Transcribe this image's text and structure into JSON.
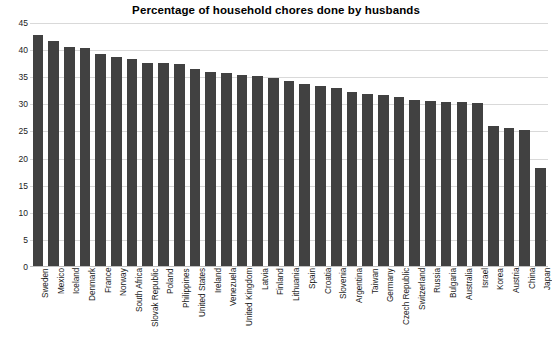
{
  "chart_data": {
    "type": "bar",
    "title": "Percentage of household chores done by husbands",
    "xlabel": "",
    "ylabel": "",
    "ylim": [
      0,
      45
    ],
    "yticks": [
      0,
      5,
      10,
      15,
      20,
      25,
      30,
      35,
      40,
      45
    ],
    "grid": true,
    "legend": null,
    "bar_color": "#414141",
    "gridline_color": "#d9d9d9",
    "categories": [
      "Sweden",
      "Mexico",
      "Iceland",
      "Denmark",
      "France",
      "Norway",
      "South Africa",
      "Slovak Republic",
      "Poland",
      "Philippines",
      "United States",
      "Ireland",
      "Venezuela",
      "United Kingdom",
      "Latvia",
      "Finland",
      "Lithuania",
      "Spain",
      "Croatia",
      "Slovenia",
      "Argentina",
      "Taiwan",
      "Germany",
      "Czech Republic",
      "Switzerland",
      "Russia",
      "Bulgaria",
      "Australia",
      "Israel",
      "Korea",
      "Austria",
      "China",
      "Japan"
    ],
    "values": [
      42.7,
      41.7,
      40.6,
      40.4,
      39.2,
      38.7,
      38.4,
      37.7,
      37.6,
      37.5,
      36.6,
      35.9,
      35.7,
      35.4,
      35.2,
      34.8,
      34.3,
      33.7,
      33.3,
      33.0,
      32.3,
      31.9,
      31.7,
      31.3,
      30.8,
      30.6,
      30.5,
      30.4,
      30.3,
      26.0,
      25.7,
      25.2,
      18.3
    ]
  }
}
